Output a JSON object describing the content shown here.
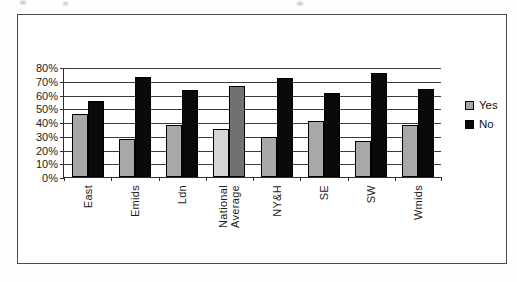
{
  "chart_data": {
    "type": "bar",
    "title": "",
    "xlabel": "",
    "ylabel": "",
    "categories": [
      "East",
      "Emids",
      "Ldn",
      "National\nAverage",
      "NY&H",
      "SE",
      "SW",
      "Wmids"
    ],
    "series": [
      {
        "name": "Yes",
        "color": "#a8a8a8",
        "values": [
          46,
          28,
          38,
          35,
          29,
          41,
          26,
          38
        ]
      },
      {
        "name": "No",
        "color": "#0a0a0a",
        "values": [
          55,
          73,
          63,
          66,
          72,
          61,
          76,
          64
        ]
      }
    ],
    "highlight": {
      "category": "National\nAverage",
      "colors": {
        "Yes": "#d5d5d5",
        "No": "#717171"
      }
    },
    "ylim": [
      0,
      80
    ],
    "y_ticks": [
      "80%",
      "70%",
      "60%",
      "50%",
      "40%",
      "30%",
      "20%",
      "10%",
      "0%"
    ],
    "grid": "horizontal",
    "legend_position": "right",
    "legend": {
      "items": [
        {
          "label": "Yes"
        },
        {
          "label": "No"
        }
      ]
    }
  }
}
